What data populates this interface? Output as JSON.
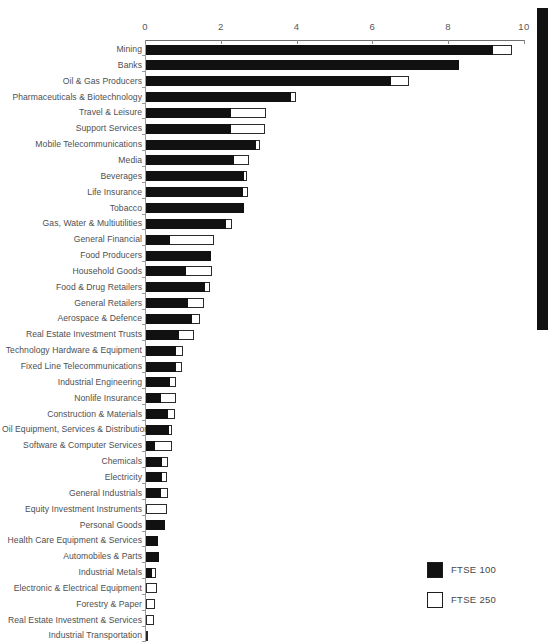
{
  "chart_data": {
    "type": "bar",
    "orientation": "horizontal",
    "stacked": true,
    "title": "",
    "subtitle": "",
    "xlabel": "",
    "ylabel": "",
    "xlim": [
      0,
      10
    ],
    "xticks": [
      0,
      2,
      4,
      6,
      8,
      10
    ],
    "xtick_labels": [
      "0",
      "2",
      "4",
      "6",
      "8",
      "10"
    ],
    "grid": false,
    "legend_position": "bottom-right",
    "legend": [
      "FTSE 100",
      "FTSE 250"
    ],
    "colors": {
      "FTSE 100": "#111111",
      "FTSE 250": "#ffffff",
      "outline": "#2a2a2a",
      "axis": "#6e6e6e",
      "text": "#4d4f52"
    },
    "categories": [
      "Mining",
      "Banks",
      "Oil & Gas Producers",
      "Pharmaceuticals & Biotechnology",
      "Travel & Leisure",
      "Support Services",
      "Mobile Telecommunications",
      "Media",
      "Beverages",
      "Life Insurance",
      "Tobacco",
      "Gas, Water & Multiutilities",
      "General Financial",
      "Food Producers",
      "Household Goods",
      "Food & Drug Retailers",
      "General Retailers",
      "Aerospace & Defence",
      "Real Estate Investment Trusts",
      "Technology Hardware & Equipment",
      "Fixed Line Telecommunications",
      "Industrial Engineering",
      "Nonlife Insurance",
      "Construction & Materials",
      "Oil Equipment, Services & Distribution",
      "Software & Computer Services",
      "Chemicals",
      "Electricity",
      "General Industrials",
      "Equity Investment Instruments",
      "Personal Goods",
      "Health Care Equipment & Services",
      "Automobiles & Parts",
      "Industrial Metals",
      "Electronic & Electrical Equipment",
      "Forestry & Paper",
      "Real Estate Investment & Services",
      "Industrial Transportation"
    ],
    "series": [
      {
        "name": "FTSE 100",
        "values": [
          9.15,
          8.26,
          6.46,
          3.83,
          2.24,
          2.24,
          2.9,
          2.32,
          2.59,
          2.56,
          2.59,
          2.11,
          0.64,
          1.72,
          1.06,
          1.56,
          1.11,
          1.21,
          0.88,
          0.79,
          0.79,
          0.64,
          0.4,
          0.59,
          0.6,
          0.25,
          0.43,
          0.43,
          0.4,
          0.0,
          0.5,
          0.31,
          0.33,
          0.15,
          0.0,
          0.0,
          0.0,
          0.0
        ]
      },
      {
        "name": "FTSE 250",
        "values": [
          0.51,
          0.0,
          0.48,
          0.13,
          0.93,
          0.9,
          0.11,
          0.4,
          0.08,
          0.13,
          0.0,
          0.16,
          1.16,
          0.0,
          0.68,
          0.13,
          0.42,
          0.22,
          0.38,
          0.18,
          0.15,
          0.15,
          0.39,
          0.18,
          0.09,
          0.44,
          0.14,
          0.13,
          0.19,
          0.56,
          0.0,
          0.0,
          0.0,
          0.12,
          0.29,
          0.25,
          0.22,
          0.04
        ]
      }
    ],
    "totals": [
      9.66,
      8.26,
      6.94,
      3.96,
      3.17,
      3.14,
      3.01,
      2.72,
      2.67,
      2.69,
      2.59,
      2.27,
      1.8,
      1.72,
      1.74,
      1.69,
      1.53,
      1.43,
      1.26,
      0.97,
      0.94,
      0.79,
      0.79,
      0.77,
      0.69,
      0.69,
      0.57,
      0.56,
      0.59,
      0.56,
      0.5,
      0.31,
      0.33,
      0.27,
      0.29,
      0.25,
      0.22,
      0.04
    ]
  },
  "legend": {
    "items": [
      {
        "label": "FTSE 100",
        "swatch": "filled"
      },
      {
        "label": "FTSE 250",
        "swatch": "hollow"
      }
    ]
  }
}
